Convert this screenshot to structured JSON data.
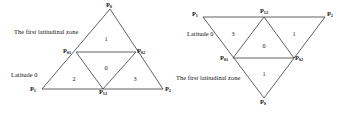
{
  "figure": {
    "panels": [
      {
        "id": "left",
        "orientation": "upright",
        "annotations": {
          "zone_label": "The first latitudinal zone",
          "latitude_label": "Latitude 0"
        },
        "vertices": [
          {
            "name": "apex",
            "base": "P",
            "sub": "0",
            "display": "P0"
          },
          {
            "name": "mid-left",
            "base": "P",
            "sub": "01",
            "display": "P01"
          },
          {
            "name": "mid-right",
            "base": "P",
            "sub": "02",
            "display": "P02"
          },
          {
            "name": "bottom-left",
            "base": "P",
            "sub": "1",
            "display": "P1"
          },
          {
            "name": "bottom-mid",
            "base": "P",
            "sub": "12",
            "display": "P12"
          },
          {
            "name": "bottom-right",
            "base": "P",
            "sub": "2",
            "display": "P2"
          }
        ],
        "cells": [
          {
            "position": "top",
            "value": "1"
          },
          {
            "position": "center",
            "value": "0"
          },
          {
            "position": "bottom-left",
            "value": "2"
          },
          {
            "position": "bottom-right",
            "value": "3"
          }
        ]
      },
      {
        "id": "right",
        "orientation": "inverted",
        "annotations": {
          "zone_label": "The first latitudinal zone",
          "latitude_label": "Latitude 0"
        },
        "vertices": [
          {
            "name": "top-left",
            "base": "P",
            "sub": "1",
            "display": "P1"
          },
          {
            "name": "top-mid",
            "base": "P",
            "sub": "12",
            "display": "P12"
          },
          {
            "name": "top-right",
            "base": "P",
            "sub": "2",
            "display": "P2"
          },
          {
            "name": "mid-left",
            "base": "P",
            "sub": "01",
            "display": "P01"
          },
          {
            "name": "mid-right",
            "base": "P",
            "sub": "02",
            "display": "P02"
          },
          {
            "name": "bottom-apex",
            "base": "P",
            "sub": "0",
            "display": "P0"
          }
        ],
        "cells": [
          {
            "position": "top-left",
            "value": "3"
          },
          {
            "position": "top-right",
            "value": "1"
          },
          {
            "position": "center",
            "value": "0"
          },
          {
            "position": "bottom",
            "value": "1"
          }
        ]
      }
    ],
    "colors": {
      "line": "#3a3a3a",
      "text": "#111111",
      "background": "#ffffff"
    }
  }
}
